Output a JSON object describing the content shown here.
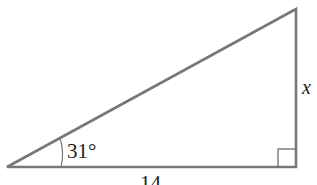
{
  "diagram": {
    "type": "right-triangle",
    "angle_label": "31°",
    "side_right_label": "x",
    "side_bottom_label": "14",
    "stroke_color": "#777777"
  }
}
